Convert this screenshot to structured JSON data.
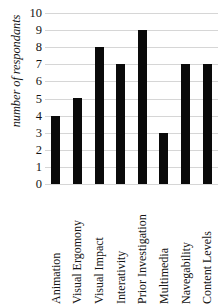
{
  "chart_data": {
    "type": "bar",
    "title": "",
    "xlabel": "",
    "ylabel": "number of respondants",
    "categories": [
      "Animation",
      "Visual Ergomony",
      "Visual Impact",
      "Interativity",
      "Prior Investigation",
      "Multimedia",
      "Navegability",
      "Content Levels"
    ],
    "values": [
      4,
      5,
      8,
      7,
      9,
      3,
      7,
      7
    ],
    "ylim": [
      0,
      10
    ],
    "ytick_labels": [
      "10",
      "9",
      "8",
      "7",
      "6",
      "5",
      "4",
      "3",
      "2",
      "1",
      "0"
    ],
    "ytick_values": [
      10,
      9,
      8,
      7,
      6,
      5,
      4,
      3,
      2,
      1,
      0
    ],
    "grid": true,
    "legend": "none",
    "bar_color": "#0a0a0a",
    "grid_color": "#d6d6d6",
    "background_color": "#ffffff"
  }
}
